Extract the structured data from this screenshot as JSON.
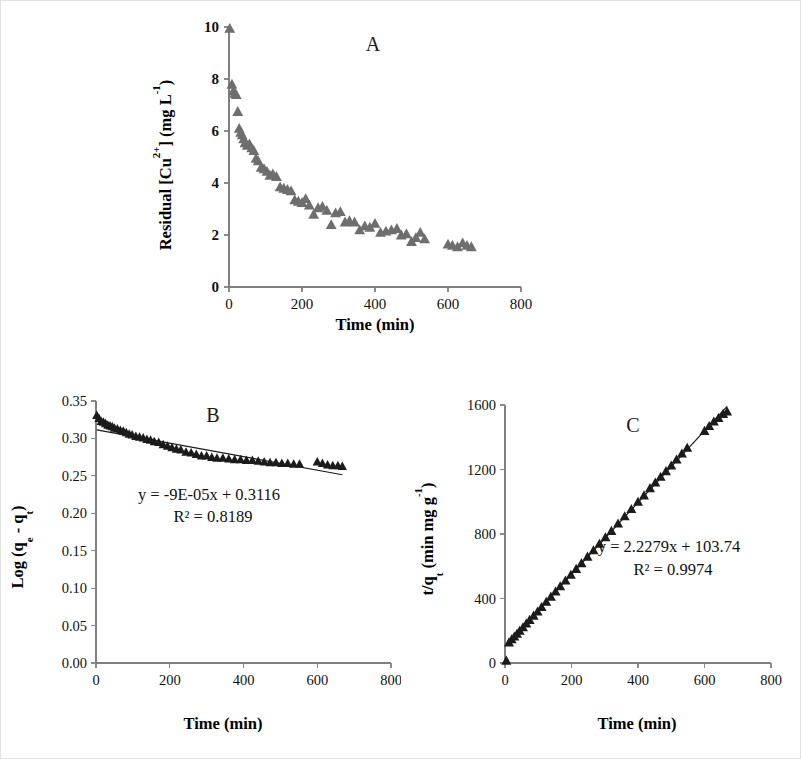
{
  "figure": {
    "background_color": "#ffffff",
    "border_color": "#e2e2e2",
    "panel_letters": {
      "a": "A",
      "b": "B",
      "c": "C"
    }
  },
  "chart_data": [
    {
      "id": "panel-a",
      "type": "scatter",
      "title": "A",
      "xlabel": "Time (min)",
      "ylabel": "Residual [Cu2+] (mg L-1)",
      "ylabel_parts": {
        "prefix": "Residual [Cu",
        "sup1": "2+",
        "mid": "] (mg L",
        "sup2": "-1",
        "suffix": ")"
      },
      "xlim": [
        0,
        800
      ],
      "ylim": [
        0,
        10
      ],
      "xticks": [
        0,
        200,
        400,
        600,
        800
      ],
      "xticklabels": [
        "0",
        "200",
        "400",
        "600",
        "800"
      ],
      "yticks": [
        0,
        2,
        4,
        6,
        8,
        10
      ],
      "yticklabels": [
        "0",
        "2",
        "4",
        "6",
        "8",
        "10"
      ],
      "grid": false,
      "legend": "none",
      "marker": "triangle",
      "marker_color": "#6e6e6e",
      "trendline": false,
      "x": [
        2,
        8,
        12,
        16,
        20,
        24,
        28,
        32,
        36,
        40,
        44,
        50,
        56,
        62,
        68,
        74,
        80,
        88,
        96,
        104,
        112,
        120,
        130,
        140,
        150,
        160,
        170,
        180,
        190,
        200,
        210,
        220,
        232,
        244,
        256,
        268,
        280,
        292,
        305,
        318,
        330,
        344,
        358,
        372,
        386,
        400,
        415,
        430,
        445,
        460,
        472,
        486,
        500,
        512,
        524,
        536,
        600,
        612,
        626,
        640,
        652,
        664
      ],
      "y": [
        9.95,
        7.8,
        7.55,
        7.45,
        7.4,
        6.75,
        6.1,
        5.95,
        5.85,
        5.7,
        5.55,
        5.45,
        5.5,
        5.35,
        5.25,
        4.95,
        4.85,
        4.6,
        4.55,
        4.45,
        4.3,
        4.35,
        4.25,
        3.85,
        3.8,
        3.75,
        3.7,
        3.35,
        3.3,
        3.25,
        3.4,
        3.15,
        2.8,
        3.05,
        3.1,
        2.95,
        2.4,
        2.85,
        2.9,
        2.5,
        2.55,
        2.5,
        2.2,
        2.35,
        2.3,
        2.45,
        2.1,
        2.15,
        2.2,
        2.25,
        2.0,
        2.05,
        1.75,
        1.9,
        2.1,
        1.85,
        1.65,
        1.6,
        1.55,
        1.7,
        1.6,
        1.55
      ]
    },
    {
      "id": "panel-b",
      "type": "scatter",
      "title": "B",
      "xlabel": "Time (min)",
      "ylabel": "Log (qe - qt)",
      "ylabel_parts": {
        "prefix": "Log (q",
        "sub1": "e",
        "mid": " - q",
        "sub2": "t",
        "suffix": ")"
      },
      "xlim": [
        0,
        800
      ],
      "ylim": [
        0.0,
        0.35
      ],
      "xticks": [
        0,
        200,
        400,
        600,
        800
      ],
      "xticklabels": [
        "0",
        "200",
        "400",
        "600",
        "800"
      ],
      "yticks": [
        0.0,
        0.05,
        0.1,
        0.15,
        0.2,
        0.25,
        0.3,
        0.35
      ],
      "yticklabels": [
        "0.00",
        "0.05",
        "0.10",
        "0.15",
        "0.20",
        "0.25",
        "0.30",
        "0.35"
      ],
      "grid": false,
      "legend": "none",
      "marker": "triangle",
      "marker_color": "#1b1b1b",
      "trendline": true,
      "trendline_equation": "y = -9E-05x + 0.3116",
      "trendline_r2": "R² = 0.8189",
      "slope": -9e-05,
      "intercept": 0.3116,
      "r2": 0.8189,
      "x": [
        2,
        8,
        14,
        20,
        26,
        32,
        38,
        44,
        50,
        58,
        66,
        74,
        82,
        90,
        98,
        108,
        118,
        128,
        138,
        148,
        158,
        170,
        182,
        194,
        206,
        218,
        230,
        244,
        258,
        272,
        286,
        300,
        314,
        328,
        344,
        360,
        376,
        392,
        408,
        424,
        440,
        456,
        472,
        488,
        504,
        520,
        536,
        552,
        600,
        614,
        628,
        642,
        656,
        668
      ],
      "y": [
        0.331,
        0.327,
        0.323,
        0.322,
        0.32,
        0.318,
        0.317,
        0.316,
        0.314,
        0.313,
        0.311,
        0.31,
        0.308,
        0.306,
        0.305,
        0.303,
        0.302,
        0.301,
        0.299,
        0.298,
        0.296,
        0.295,
        0.292,
        0.29,
        0.288,
        0.286,
        0.285,
        0.282,
        0.281,
        0.279,
        0.277,
        0.277,
        0.275,
        0.274,
        0.274,
        0.273,
        0.272,
        0.272,
        0.271,
        0.271,
        0.27,
        0.269,
        0.268,
        0.268,
        0.267,
        0.267,
        0.266,
        0.266,
        0.269,
        0.267,
        0.265,
        0.264,
        0.264,
        0.263
      ]
    },
    {
      "id": "panel-c",
      "type": "scatter",
      "title": "C",
      "xlabel": "Time (min)",
      "ylabel": "t/qt (min mg g-1)",
      "ylabel_parts": {
        "prefix": "t/q",
        "sub1": "t",
        "mid": " (min mg g",
        "sup1": "-1",
        "suffix": ")"
      },
      "xlim": [
        0,
        800
      ],
      "ylim": [
        0,
        1600
      ],
      "xticks": [
        0,
        200,
        400,
        600,
        800
      ],
      "xticklabels": [
        "0",
        "200",
        "400",
        "600",
        "800"
      ],
      "yticks": [
        0,
        400,
        800,
        1200,
        1600
      ],
      "yticklabels": [
        "0",
        "400",
        "800",
        "1200",
        "1600"
      ],
      "grid": false,
      "legend": "none",
      "marker": "triangle",
      "marker_color": "#1b1b1b",
      "trendline": true,
      "trendline_equation": "y = 2.2279x + 103.74",
      "trendline_r2": "R² = 0.9974",
      "slope": 2.2279,
      "intercept": 103.74,
      "r2": 0.9974,
      "x": [
        4,
        12,
        20,
        28,
        36,
        44,
        54,
        64,
        74,
        86,
        98,
        110,
        124,
        138,
        152,
        166,
        182,
        198,
        214,
        230,
        248,
        266,
        284,
        302,
        320,
        340,
        360,
        380,
        400,
        418,
        436,
        452,
        468,
        484,
        500,
        516,
        532,
        548,
        600,
        614,
        628,
        642,
        656,
        668
      ],
      "y": [
        15,
        128,
        148,
        165,
        182,
        200,
        222,
        245,
        268,
        294,
        320,
        348,
        380,
        412,
        444,
        476,
        512,
        548,
        584,
        620,
        660,
        700,
        740,
        780,
        820,
        865,
        910,
        955,
        1000,
        1040,
        1085,
        1120,
        1155,
        1190,
        1225,
        1262,
        1300,
        1335,
        1440,
        1470,
        1498,
        1520,
        1545,
        1560
      ]
    }
  ]
}
